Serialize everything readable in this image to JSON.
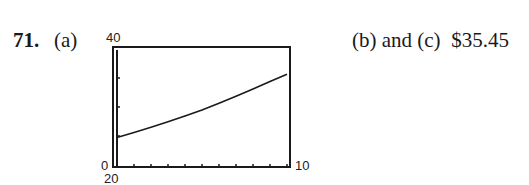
{
  "problem": {
    "number": "71.",
    "part_a_label": "(a)",
    "part_bc_label": "(b) and (c)",
    "part_bc_answer": "$35.45"
  },
  "window_labels": {
    "ymax": "40",
    "ymin": "0",
    "xmax": "10",
    "xmin_below": "20"
  },
  "chart_data": {
    "type": "line",
    "title": "",
    "xlabel": "",
    "ylabel": "",
    "xlim": [
      0,
      10
    ],
    "ylim": [
      0,
      40
    ],
    "xscl": 1,
    "yscl": 10,
    "grid": false,
    "legend": null,
    "window_tick_labels": {
      "ymax": "40",
      "ymin": "0",
      "xmax": "10",
      "bottom_label": "20"
    },
    "series": [
      {
        "name": "curve",
        "x": [
          0,
          1,
          2,
          3,
          4,
          5,
          6,
          7,
          8,
          9,
          10
        ],
        "y": [
          9.5,
          11.2,
          13.0,
          14.9,
          16.9,
          19.0,
          21.3,
          23.7,
          26.2,
          28.8,
          31.3
        ]
      }
    ]
  }
}
